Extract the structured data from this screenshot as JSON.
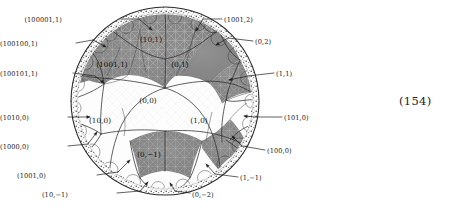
{
  "figure": {
    "type": "poincare-disk-tessellation",
    "disk": {
      "cx": 165,
      "cy": 101,
      "r": 94
    },
    "colors": {
      "background": "#ffffff",
      "tile_grey": "#8b8b8b",
      "tile_grey_dark": "#7b7b7b",
      "tile_white": "#fdfdfd",
      "line": "#2a2a2a",
      "fine_line": "#c9c9c9",
      "text": "#1a1a1a",
      "boundary": "#303030"
    },
    "caption_number": "(154)"
  },
  "inner_labels": [
    {
      "id": "region-10-1",
      "text": "(10,1)",
      "x": 151,
      "y": 40,
      "shaded": true
    },
    {
      "id": "region-1001-1",
      "text": "(1001,1)",
      "x": 112,
      "y": 65,
      "shaded": true
    },
    {
      "id": "region-0-1",
      "text": "(0,1)",
      "x": 180,
      "y": 65,
      "shaded": true
    },
    {
      "id": "region-0-0",
      "text": "(0,0)",
      "x": 148,
      "y": 101,
      "shaded": false
    },
    {
      "id": "region-10-0",
      "text": "(10,0)",
      "x": 100,
      "y": 121,
      "shaded": false
    },
    {
      "id": "region-1-0",
      "text": "(1,0)",
      "x": 199,
      "y": 121,
      "shaded": false
    },
    {
      "id": "region-0-minus1",
      "text": "(0,−1)",
      "x": 149,
      "y": 155,
      "shaded": true
    }
  ],
  "callouts": [
    {
      "id": "callout-100001-1",
      "text": "(100001,1)",
      "tx": 62,
      "ty": 17,
      "anchor": "right",
      "leader": [
        [
          121,
          19
        ],
        [
          139,
          19
        ]
      ],
      "arrow": [
        [
          139,
          19
        ],
        [
          152,
          30
        ]
      ]
    },
    {
      "id": "callout-1001-2",
      "text": "(1001,2)",
      "tx": 224,
      "ty": 17,
      "anchor": "left",
      "leader": [
        [
          222,
          19
        ],
        [
          203,
          19
        ]
      ],
      "arrow": [
        [
          203,
          19
        ],
        [
          196,
          31
        ]
      ]
    },
    {
      "id": "callout-100100-1",
      "text": "(100100,1)",
      "tx": 14,
      "ty": 41,
      "anchor": "right",
      "leader": [
        [
          76,
          43
        ],
        [
          93,
          40
        ]
      ],
      "arrow": [
        [
          93,
          40
        ],
        [
          106,
          47
        ]
      ]
    },
    {
      "id": "callout-0-2",
      "text": "(0,2)",
      "tx": 255,
      "ty": 39,
      "anchor": "left",
      "leader": [
        [
          253,
          41
        ],
        [
          228,
          38
        ]
      ],
      "arrow": [
        [
          228,
          38
        ],
        [
          216,
          45
        ]
      ]
    },
    {
      "id": "callout-100101-1",
      "text": "(100101,1)",
      "tx": 11,
      "ty": 71,
      "anchor": "right",
      "leader": [
        [
          73,
          73
        ],
        [
          95,
          76
        ]
      ],
      "arrow": [
        [
          95,
          76
        ],
        [
          104,
          83
        ]
      ]
    },
    {
      "id": "callout-1-1",
      "text": "(1,1)",
      "tx": 276,
      "ty": 71,
      "anchor": "left",
      "leader": [
        [
          274,
          73
        ],
        [
          248,
          76
        ]
      ],
      "arrow": [
        [
          248,
          76
        ],
        [
          229,
          80
        ]
      ]
    },
    {
      "id": "callout-1010-0",
      "text": "(1010,0)",
      "tx": 15,
      "ty": 115,
      "anchor": "right",
      "leader": [
        [
          68,
          117
        ],
        [
          78,
          117
        ]
      ],
      "arrow": [
        [
          78,
          117
        ],
        [
          90,
          117
        ]
      ]
    },
    {
      "id": "callout-101-0",
      "text": "(101,0)",
      "tx": 284,
      "ty": 115,
      "anchor": "left",
      "leader": [
        [
          282,
          117
        ],
        [
          256,
          117
        ]
      ],
      "arrow": [
        [
          256,
          117
        ],
        [
          244,
          116
        ]
      ]
    },
    {
      "id": "callout-1000-0",
      "text": "(1000,0)",
      "tx": 15,
      "ty": 144,
      "anchor": "right",
      "leader": [
        [
          68,
          146
        ],
        [
          88,
          144
        ]
      ],
      "arrow": [
        [
          88,
          144
        ],
        [
          97,
          132
        ]
      ]
    },
    {
      "id": "callout-100-0",
      "text": "(100,0)",
      "tx": 267,
      "ty": 148,
      "anchor": "left",
      "leader": [
        [
          265,
          150
        ],
        [
          242,
          146
        ]
      ],
      "arrow": [
        [
          242,
          146
        ],
        [
          232,
          136
        ]
      ]
    },
    {
      "id": "callout-1001-0",
      "text": "(1001,0)",
      "tx": 46,
      "ty": 173,
      "anchor": "right",
      "leader": [
        [
          97,
          175
        ],
        [
          118,
          172
        ]
      ],
      "arrow": [
        [
          118,
          172
        ],
        [
          130,
          160
        ]
      ]
    },
    {
      "id": "callout-1-minus1",
      "text": "(1,−1)",
      "tx": 240,
      "ty": 175,
      "anchor": "left",
      "leader": [
        [
          238,
          177
        ],
        [
          215,
          174
        ]
      ],
      "arrow": [
        [
          215,
          174
        ],
        [
          206,
          164
        ]
      ]
    },
    {
      "id": "callout-10-minus1",
      "text": "(10,−1)",
      "tx": 68,
      "ty": 192,
      "anchor": "right",
      "leader": [
        [
          117,
          193
        ],
        [
          140,
          191
        ]
      ],
      "arrow": [
        [
          140,
          191
        ],
        [
          148,
          182
        ]
      ]
    },
    {
      "id": "callout-0-minus2",
      "text": "(0,−2)",
      "tx": 192,
      "ty": 192,
      "anchor": "left",
      "leader": [
        [
          190,
          193
        ],
        [
          175,
          191
        ]
      ],
      "arrow": [
        [
          175,
          191
        ],
        [
          170,
          183
        ]
      ]
    }
  ]
}
